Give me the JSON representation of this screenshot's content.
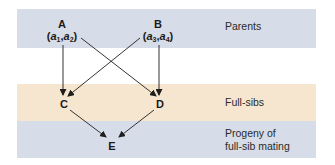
{
  "colors": {
    "parents_band": "#d7dde8",
    "fullsibs_band": "#f6e6cf",
    "progeny_band": "#d7dde8",
    "arrow": "#1e1e1e",
    "text": "#1a1a1a"
  },
  "nodes": {
    "A": {
      "label": "A",
      "allele1": "a",
      "allele1_sub": "1",
      "allele2": "a",
      "allele2_sub": "2"
    },
    "B": {
      "label": "B",
      "allele1": "a",
      "allele1_sub": "3",
      "allele2": "a",
      "allele2_sub": "4"
    },
    "C": {
      "label": "C"
    },
    "D": {
      "label": "D"
    },
    "E": {
      "label": "E"
    }
  },
  "rows": {
    "parents": "Parents",
    "fullsibs": "Full-sibs",
    "progeny_line1": "Progeny of",
    "progeny_line2": "full-sib mating"
  },
  "edges": [
    {
      "from": "A",
      "to": "C"
    },
    {
      "from": "A",
      "to": "D"
    },
    {
      "from": "B",
      "to": "C"
    },
    {
      "from": "B",
      "to": "D"
    },
    {
      "from": "C",
      "to": "E"
    },
    {
      "from": "D",
      "to": "E"
    }
  ],
  "punct": {
    "open": "(",
    "comma": ",",
    "close": ")"
  }
}
